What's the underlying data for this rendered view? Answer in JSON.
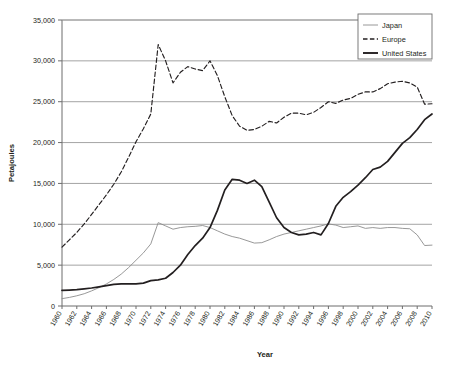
{
  "chart_data": {
    "type": "line",
    "title": "",
    "xlabel": "Year",
    "ylabel": "Petajoules",
    "xlim": [
      1960,
      2010
    ],
    "ylim": [
      0,
      35000
    ],
    "grid": true,
    "legend_position": "top-right",
    "ytick_labels": [
      "0",
      "5,000",
      "10,000",
      "15,000",
      "20,000",
      "25,000",
      "30,000",
      "35,000"
    ],
    "ytick_values": [
      0,
      5000,
      10000,
      15000,
      20000,
      25000,
      30000,
      35000
    ],
    "xtick_labels": [
      "1960",
      "1962",
      "1964",
      "1966",
      "1968",
      "1970",
      "1972",
      "1974",
      "1976",
      "1978",
      "1980",
      "1982",
      "1984",
      "1986",
      "1988",
      "1990",
      "1992",
      "1994",
      "1996",
      "1998",
      "2000",
      "2002",
      "2004",
      "2006",
      "2008",
      "2010"
    ],
    "x": [
      1960,
      1961,
      1962,
      1963,
      1964,
      1965,
      1966,
      1967,
      1968,
      1969,
      1970,
      1971,
      1972,
      1973,
      1974,
      1975,
      1976,
      1977,
      1978,
      1979,
      1980,
      1981,
      1982,
      1983,
      1984,
      1985,
      1986,
      1987,
      1988,
      1989,
      1990,
      1991,
      1992,
      1993,
      1994,
      1995,
      1996,
      1997,
      1998,
      1999,
      2000,
      2001,
      2002,
      2003,
      2004,
      2005,
      2006,
      2007,
      2008,
      2009,
      2010
    ],
    "series": [
      {
        "name": "Japan",
        "color": "#8c8c8c",
        "style": "solid-thin",
        "values": [
          900,
          1050,
          1250,
          1500,
          1850,
          2250,
          2700,
          3250,
          3900,
          4700,
          5600,
          6500,
          7600,
          10200,
          9800,
          9400,
          9600,
          9700,
          9750,
          9850,
          9600,
          9200,
          8800,
          8500,
          8300,
          8000,
          7700,
          7750,
          8100,
          8500,
          8800,
          9000,
          9200,
          9400,
          9600,
          9800,
          10050,
          9900,
          9600,
          9700,
          9800,
          9500,
          9600,
          9500,
          9600,
          9600,
          9500,
          9450,
          8700,
          7400,
          7450
        ]
      },
      {
        "name": "Europe",
        "color": "#231f20",
        "style": "dashed",
        "values": [
          7200,
          8100,
          9000,
          10050,
          11200,
          12400,
          13600,
          14900,
          16400,
          18200,
          20100,
          21700,
          23500,
          32000,
          30000,
          27300,
          28600,
          29300,
          29000,
          28800,
          30000,
          28200,
          25600,
          23300,
          22000,
          21500,
          21600,
          22000,
          22600,
          22400,
          23100,
          23600,
          23600,
          23400,
          23700,
          24300,
          25000,
          24800,
          25200,
          25400,
          25900,
          26200,
          26200,
          26600,
          27200,
          27400,
          27500,
          27300,
          26800,
          24700,
          24750
        ]
      },
      {
        "name": "United States",
        "color": "#231f20",
        "style": "solid-thick",
        "values": [
          1900,
          1950,
          2000,
          2100,
          2200,
          2350,
          2500,
          2650,
          2700,
          2700,
          2700,
          2800,
          3100,
          3200,
          3400,
          4100,
          5000,
          6300,
          7400,
          8300,
          9600,
          11700,
          14200,
          15500,
          15400,
          15000,
          15400,
          14600,
          12700,
          10800,
          9600,
          9000,
          8700,
          8800,
          9000,
          8700,
          10100,
          12200,
          13300,
          14000,
          14800,
          15700,
          16700,
          17000,
          17700,
          18800,
          19900,
          20600,
          21600,
          22800,
          23500
        ]
      }
    ]
  },
  "legend": {
    "items": [
      {
        "label": "Japan"
      },
      {
        "label": "Europe"
      },
      {
        "label": "United States"
      }
    ]
  },
  "axes": {
    "x_title": "Year",
    "y_title": "Petajoules"
  }
}
